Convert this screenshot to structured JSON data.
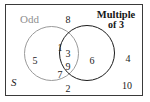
{
  "figure": {
    "type": "venn-diagram-2-set",
    "universal_set_label": "S",
    "sets": [
      {
        "key": "odd",
        "label": "Odd",
        "color": "#9a9a9a",
        "exclusive_members": [
          "1",
          "5",
          "7"
        ]
      },
      {
        "key": "multiple_of_3",
        "label_line1": "Multiple",
        "label_line2": "of 3",
        "color": "#1c1c1c",
        "exclusive_members": [
          "6"
        ]
      }
    ],
    "intersection_members": [
      "3",
      "9"
    ],
    "outside_members": [
      "8",
      "2",
      "4",
      "10"
    ],
    "elements": {
      "one": "1",
      "five": "5",
      "seven": "7",
      "three": "3",
      "nine": "9",
      "six": "6",
      "eight": "8",
      "two": "2",
      "four": "4",
      "ten": "10"
    },
    "colors": {
      "frame": "#3a3a3a",
      "odd_circle": "#9a9a9a",
      "multiple_circle": "#1c1c1c",
      "text": "#1c1c1c",
      "odd_label_text": "#8f8f8f",
      "background": "#ffffff"
    }
  },
  "chart_data": {
    "type": "table",
    "categories": [
      "Odd only",
      "Intersection (Odd and Multiple of 3)",
      "Multiple of 3 only",
      "Outside both (S only)"
    ],
    "values": [
      3,
      2,
      1,
      4
    ],
    "members": {
      "Odd only": [
        "1",
        "5",
        "7"
      ],
      "Intersection (Odd and Multiple of 3)": [
        "3",
        "9"
      ],
      "Multiple of 3 only": [
        "6"
      ],
      "Outside both (S only)": [
        "8",
        "2",
        "4",
        "10"
      ]
    },
    "xlabel": "Region",
    "ylabel": "Count of elements"
  }
}
